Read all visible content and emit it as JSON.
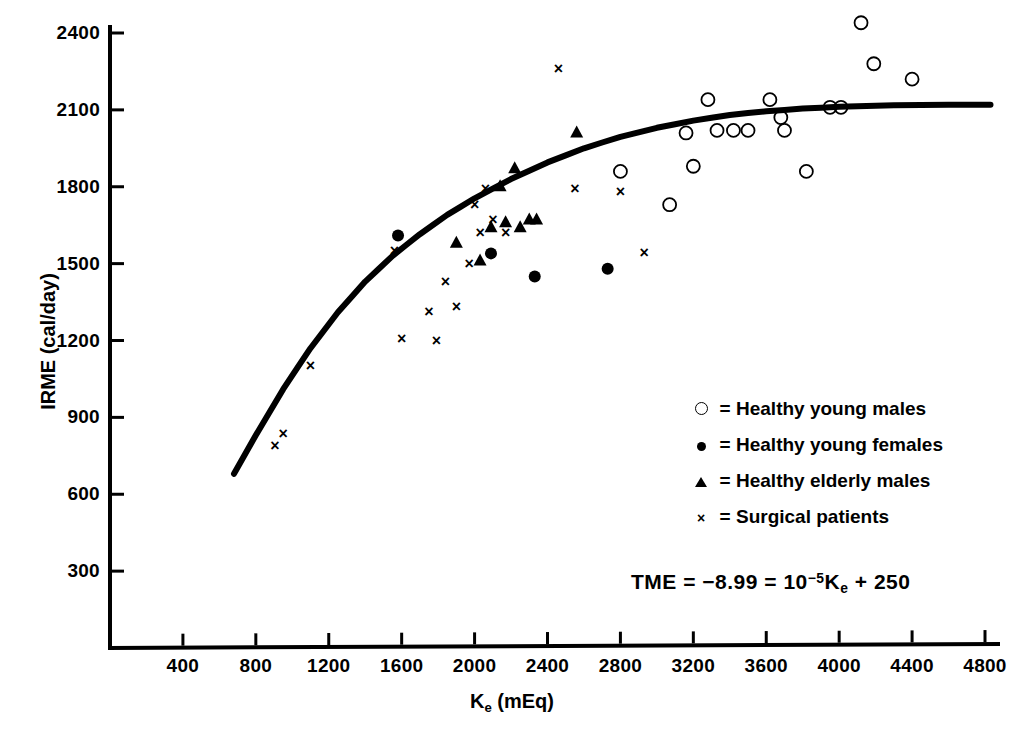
{
  "chart_data": {
    "type": "scatter",
    "title": "",
    "xlabel": "K_e (mEq)",
    "ylabel": "IRME (cal/day)",
    "xlim": [
      0,
      5000
    ],
    "ylim": [
      0,
      2550
    ],
    "grid": false,
    "legend_position": "inside-right",
    "x_ticks": [
      400,
      800,
      1200,
      1600,
      2000,
      2400,
      2800,
      3200,
      3600,
      4000,
      4400,
      4800
    ],
    "y_ticks": [
      300,
      600,
      900,
      1200,
      1500,
      1800,
      2100,
      2400
    ],
    "series": [
      {
        "name": "Healthy young males",
        "marker": "open-circle",
        "points": [
          [
            2800,
            1860
          ],
          [
            3070,
            1730
          ],
          [
            3160,
            2010
          ],
          [
            3200,
            1880
          ],
          [
            3280,
            2140
          ],
          [
            3330,
            2020
          ],
          [
            3420,
            2020
          ],
          [
            3500,
            2020
          ],
          [
            3620,
            2140
          ],
          [
            3680,
            2070
          ],
          [
            3700,
            2020
          ],
          [
            3820,
            1860
          ],
          [
            3950,
            2110
          ],
          [
            4010,
            2110
          ],
          [
            4120,
            2440
          ],
          [
            4190,
            2280
          ],
          [
            4400,
            2220
          ]
        ]
      },
      {
        "name": "Healthy young females",
        "marker": "filled-circle",
        "points": [
          [
            1580,
            1610
          ],
          [
            2090,
            1540
          ],
          [
            2330,
            1450
          ],
          [
            2730,
            1480
          ]
        ]
      },
      {
        "name": "Healthy elderly males",
        "marker": "filled-triangle",
        "points": [
          [
            1900,
            1580
          ],
          [
            2030,
            1510
          ],
          [
            2090,
            1640
          ],
          [
            2140,
            1800
          ],
          [
            2170,
            1660
          ],
          [
            2220,
            1870
          ],
          [
            2250,
            1640
          ],
          [
            2300,
            1670
          ],
          [
            2340,
            1670
          ],
          [
            2560,
            2010
          ]
        ]
      },
      {
        "name": "Surgical patients",
        "marker": "x",
        "points": [
          [
            905,
            790
          ],
          [
            950,
            835
          ],
          [
            1100,
            1100
          ],
          [
            1560,
            1550
          ],
          [
            1600,
            1205
          ],
          [
            1750,
            1310
          ],
          [
            1790,
            1200
          ],
          [
            1840,
            1430
          ],
          [
            1900,
            1330
          ],
          [
            1970,
            1500
          ],
          [
            2000,
            1730
          ],
          [
            2030,
            1620
          ],
          [
            2060,
            1790
          ],
          [
            2100,
            1670
          ],
          [
            2170,
            1620
          ],
          [
            2460,
            2260
          ],
          [
            2550,
            1790
          ],
          [
            2800,
            1780
          ],
          [
            2930,
            1540
          ]
        ]
      }
    ],
    "fit_curve": {
      "label": "fitted curve",
      "x_start": 680,
      "x_end": 4830,
      "y_start": 680,
      "y_end": 2120,
      "points": [
        [
          680,
          680
        ],
        [
          800,
          830
        ],
        [
          950,
          1010
        ],
        [
          1100,
          1170
        ],
        [
          1250,
          1310
        ],
        [
          1400,
          1430
        ],
        [
          1550,
          1530
        ],
        [
          1700,
          1615
        ],
        [
          1850,
          1690
        ],
        [
          2000,
          1755
        ],
        [
          2200,
          1830
        ],
        [
          2400,
          1895
        ],
        [
          2600,
          1950
        ],
        [
          2800,
          1995
        ],
        [
          3000,
          2030
        ],
        [
          3200,
          2058
        ],
        [
          3400,
          2080
        ],
        [
          3600,
          2095
        ],
        [
          3800,
          2105
        ],
        [
          4000,
          2112
        ],
        [
          4300,
          2118
        ],
        [
          4600,
          2120
        ],
        [
          4830,
          2120
        ]
      ]
    },
    "annotations": [
      {
        "name": "regression-equation",
        "text": "TME = −8.99 = 10⁻⁵Kₑ + 250"
      }
    ]
  },
  "axes": {
    "ylabel": "IRME (cal/day)",
    "xlabel_main": "K",
    "xlabel_sub": "e",
    "xlabel_unit": " (mEq)",
    "y_tick_labels": [
      "2400",
      "2100",
      "1800",
      "1500",
      "1200",
      "900",
      "600",
      "300"
    ],
    "x_tick_labels": [
      "400",
      "800",
      "1200",
      "1600",
      "2000",
      "2400",
      "2800",
      "3200",
      "3600",
      "4000",
      "4400",
      "4800"
    ]
  },
  "legend": {
    "items": [
      {
        "symbol": "open-circle",
        "equals": "=",
        "label": "Healthy young males"
      },
      {
        "symbol": "filled-circle",
        "equals": "=",
        "label": "Healthy young females"
      },
      {
        "symbol": "filled-triangle",
        "equals": "=",
        "label": "Healthy elderly males"
      },
      {
        "symbol": "x-mark",
        "equals": "=",
        "label": "Surgical patients"
      }
    ]
  },
  "equation": {
    "lead": "TME",
    "eq1": "=",
    "coef": "−8.99",
    "eq2": "=",
    "base": "10",
    "exponent": "−5",
    "variable": "K",
    "variable_sub": "e",
    "plus": "+",
    "constant": "250"
  },
  "colors": {
    "ink": "#000000",
    "background": "#ffffff"
  }
}
